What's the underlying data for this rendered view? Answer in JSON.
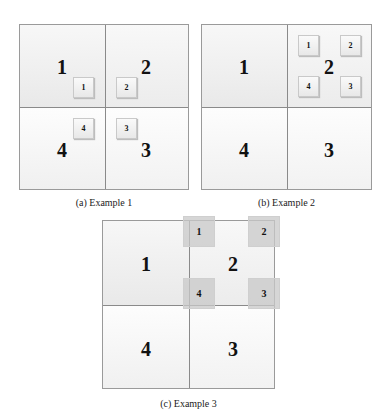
{
  "panels": {
    "a": {
      "caption": "(a)  Example 1",
      "quadrants": {
        "tl": "1",
        "tr": "2",
        "br": "3",
        "bl": "4"
      },
      "subboxes": {
        "b1": "1",
        "b2": "2",
        "b3": "3",
        "b4": "4"
      }
    },
    "b": {
      "caption": "(b)  Example 2",
      "quadrants": {
        "tl": "1",
        "tr": "2",
        "br": "3",
        "bl": "4"
      },
      "subboxes": {
        "b1": "1",
        "b2": "2",
        "b3": "3",
        "b4": "4"
      }
    },
    "c": {
      "caption": "(c)  Example 3",
      "quadrants": {
        "tl": "1",
        "tr": "2",
        "br": "3",
        "bl": "4"
      },
      "subboxes": {
        "b1": "1",
        "b2": "2",
        "b3": "3",
        "b4": "4"
      }
    }
  },
  "colors": {
    "border": "#9a9a9a",
    "quadrant_fill": "#efefef",
    "overlay_box": "#c8c8c8"
  }
}
